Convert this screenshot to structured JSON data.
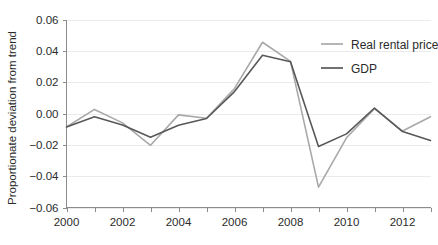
{
  "chart_data": {
    "type": "line",
    "title": "",
    "xlabel": "",
    "ylabel": "Proportionate deviation from trend",
    "x": [
      2000,
      2001,
      2002,
      2003,
      2004,
      2005,
      2006,
      2007,
      2008,
      2009,
      2010,
      2011,
      2012,
      2013
    ],
    "xlim": [
      2000,
      2013
    ],
    "ylim": [
      -0.06,
      0.06
    ],
    "grid": true,
    "legend_position": "top-right",
    "x_tick_values": [
      2000,
      2001,
      2002,
      2003,
      2004,
      2005,
      2006,
      2007,
      2008,
      2009,
      2010,
      2011,
      2012,
      2013
    ],
    "x_tick_labels": [
      "2000",
      "",
      "2002",
      "",
      "2004",
      "",
      "2006",
      "",
      "2008",
      "",
      "2010",
      "",
      "2012",
      ""
    ],
    "y_tick_values": [
      0.06,
      0.04,
      0.02,
      0.0,
      -0.02,
      -0.04,
      -0.06
    ],
    "y_tick_labels": [
      "0.06",
      "0.04",
      "0.02",
      "0.00",
      "−0.02",
      "−0.04",
      "−0.06"
    ],
    "series": [
      {
        "name": "Real rental price",
        "color": "#a9a9a9",
        "width": 1.6,
        "values": [
          -0.0086,
          0.0026,
          -0.006,
          -0.0203,
          -0.0009,
          -0.003,
          0.016,
          0.0455,
          0.0333,
          -0.047,
          -0.0155,
          0.0031,
          -0.0112,
          -0.0021
        ]
      },
      {
        "name": "GDP",
        "color": "#585858",
        "width": 1.6,
        "values": [
          -0.0086,
          -0.0021,
          -0.0074,
          -0.0151,
          -0.0075,
          -0.0032,
          0.014,
          0.0372,
          0.033,
          -0.0211,
          -0.013,
          0.0035,
          -0.0115,
          -0.0173
        ]
      }
    ]
  },
  "legend": {
    "entries": [
      {
        "label": "Real rental price",
        "color": "#a9a9a9"
      },
      {
        "label": "GDP",
        "color": "#585858"
      }
    ]
  },
  "axes": {
    "y_title": "Proportionate deviation from trend"
  }
}
